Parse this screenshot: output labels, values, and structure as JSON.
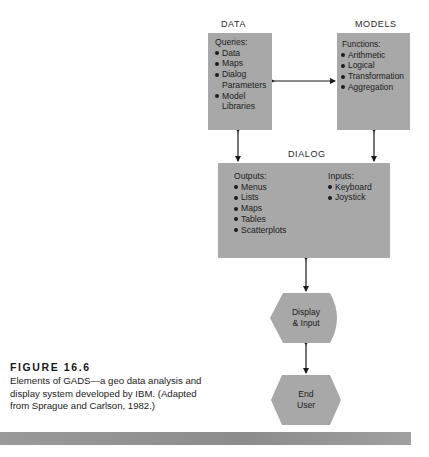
{
  "diagram": {
    "data": {
      "heading": "DATA",
      "title": "Queries:",
      "items": [
        "Data",
        "Maps",
        "Dialog",
        "Parameters",
        "Model",
        "Libraries"
      ]
    },
    "models": {
      "heading": "MODELS",
      "title": "Functions:",
      "items": [
        "Arithmetic",
        "Logical",
        "Transformation",
        "Aggregation"
      ]
    },
    "dialog": {
      "heading": "DIALOG",
      "outputs_title": "Outputs:",
      "outputs": [
        "Menus",
        "Lists",
        "Maps",
        "Tables",
        "Scatterplots"
      ],
      "inputs_title": "Inputs:",
      "inputs": [
        "Keyboard",
        "Joystick"
      ]
    },
    "display": {
      "line1": "Display",
      "line2": "& Input"
    },
    "end_user": {
      "line1": "End",
      "line2": "User"
    },
    "connections": [
      {
        "from": "DATA",
        "to": "MODELS",
        "type": "bidirectional"
      },
      {
        "from": "DATA",
        "to": "DIALOG",
        "type": "bidirectional"
      },
      {
        "from": "MODELS",
        "to": "DIALOG",
        "type": "bidirectional"
      },
      {
        "from": "DIALOG",
        "to": "Display & Input",
        "type": "bidirectional"
      },
      {
        "from": "Display & Input",
        "to": "End User",
        "type": "bidirectional"
      }
    ],
    "colors": {
      "box_fill": "#a8a8a8",
      "line": "#1a1a1a",
      "bar": "#959595"
    }
  },
  "caption": {
    "title": "FIGURE 16.6",
    "body": "Elements of GADS—a geo data analysis and display system developed by IBM. (Adapted from Sprague and Carlson, 1982.)"
  }
}
